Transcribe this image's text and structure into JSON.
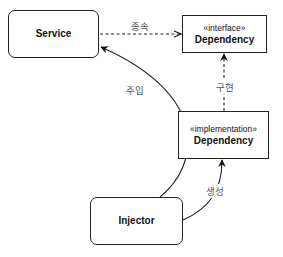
{
  "nodes": {
    "service": {
      "title": "Service"
    },
    "interface_dependency": {
      "stereotype": "«interface»",
      "title": "Dependency"
    },
    "implementation_dependency": {
      "stereotype": "«implementation»",
      "title": "Dependency"
    },
    "injector": {
      "title": "Injector"
    }
  },
  "edges": {
    "depends": {
      "label": "종속",
      "from": "Service",
      "to": "«interface» Dependency",
      "style": "dashed, open arrow"
    },
    "implements": {
      "label": "구현",
      "from": "«implementation» Dependency",
      "to": "«interface» Dependency",
      "style": "dashed, filled arrow"
    },
    "injects": {
      "label": "주입",
      "from": "Injector",
      "to": "Service",
      "style": "solid curve, filled arrow"
    },
    "creates": {
      "label": "생성",
      "from": "Injector",
      "to": "«implementation» Dependency",
      "style": "solid curve, filled arrow"
    }
  },
  "colors": {
    "stroke": "#222222",
    "label": "#555555",
    "background": "#ffffff"
  }
}
